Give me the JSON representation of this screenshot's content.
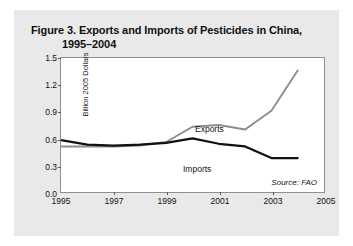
{
  "figure": {
    "title_line1": "Figure 3. Exports and Imports of Pesticides in China,",
    "title_line2": "1995–2004",
    "source_note": "Source: FAO",
    "background_color": "#e9e9e9",
    "plot_background_color": "#ffffff",
    "frame_color": "#8f8f8f"
  },
  "chart_data": {
    "type": "line",
    "title": "Figure 3. Exports and Imports of Pesticides in China, 1995–2004",
    "xlabel": "",
    "ylabel": "Billion 2005 Dollars",
    "xlim": [
      1995,
      2005
    ],
    "ylim": [
      0.0,
      1.5
    ],
    "xticks": [
      1995,
      1997,
      1999,
      2001,
      2003,
      2005
    ],
    "xtick_labels": [
      "1995",
      "1997",
      "1999",
      "2001",
      "2003",
      "2005"
    ],
    "yticks": [
      0.0,
      0.3,
      0.6,
      0.9,
      1.2,
      1.5
    ],
    "ytick_labels": [
      "0.0",
      "0.3",
      "0.6",
      "0.9",
      "1.2",
      "1.5"
    ],
    "grid": false,
    "legend_position": "inline-annotations",
    "x": [
      1995,
      1996,
      1997,
      1998,
      1999,
      2000,
      2001,
      2002,
      2003,
      2004
    ],
    "series": [
      {
        "name": "Exports",
        "color": "#8c8c8c",
        "label_text": "Exports",
        "values": [
          0.51,
          0.51,
          0.51,
          0.52,
          0.56,
          0.73,
          0.75,
          0.7,
          0.91,
          1.36
        ]
      },
      {
        "name": "Imports",
        "color": "#111111",
        "label_text": "Imports",
        "values": [
          0.58,
          0.53,
          0.52,
          0.53,
          0.55,
          0.6,
          0.54,
          0.51,
          0.38,
          0.38
        ]
      }
    ]
  }
}
